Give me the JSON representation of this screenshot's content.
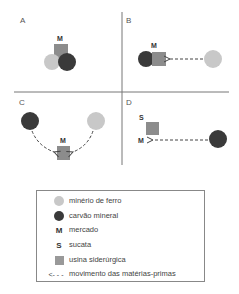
{
  "colors": {
    "iron_ore": "#c8c8c8",
    "coal": "#3a3a3a",
    "steel_mill": "#8c8c8c",
    "lines": "#777777"
  },
  "panels": [
    {
      "id": "A",
      "label": "A",
      "market_label": "M"
    },
    {
      "id": "B",
      "label": "B",
      "market_label": "M"
    },
    {
      "id": "C",
      "label": "C",
      "market_label": "M"
    },
    {
      "id": "D",
      "label": "D",
      "market_label": "M",
      "scrap_label": "S"
    }
  ],
  "legend": {
    "items": [
      {
        "icon": "light-circle",
        "label": "minério de ferro"
      },
      {
        "icon": "dark-circle",
        "label": "carvão mineral"
      },
      {
        "icon": "letter-M",
        "symbol": "M",
        "label": "mercado"
      },
      {
        "icon": "letter-S",
        "symbol": "S",
        "label": "sucata"
      },
      {
        "icon": "gray-square",
        "label": "usina siderúrgica"
      },
      {
        "icon": "dashed-arrow",
        "symbol": "<- - -",
        "label": "movimento das matérias-primas"
      }
    ]
  }
}
